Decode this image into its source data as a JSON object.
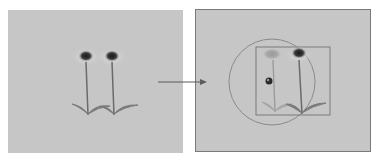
{
  "diagram": {
    "left_panel": {
      "label": "original image",
      "objects": [
        "flower",
        "flower"
      ]
    },
    "arrow": {
      "direction": "right"
    },
    "right_panel": {
      "label": "edited image",
      "objects": [
        "faded flower",
        "flower",
        "selection circle",
        "bounding box",
        "cursor"
      ]
    },
    "colors": {
      "background": "#c6c6c6",
      "stem": "#6a6a6a",
      "flower_head": "#2a2a2a",
      "outline": "#7a7a7a"
    }
  }
}
